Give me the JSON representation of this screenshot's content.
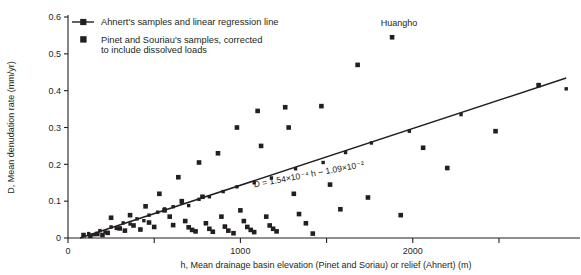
{
  "chart_data": {
    "type": "scatter",
    "title": "",
    "xlabel": "h, Mean drainage basin elevation (Pinet and Soriau) or relief (Ahnert)  (m)",
    "ylabel": "D, Mean denudation rate  (mm/yr)",
    "xlim": [
      0,
      2970
    ],
    "ylim": [
      0,
      0.6
    ],
    "grid": false,
    "legend_position": "top-left",
    "x_ticks": [
      0,
      500,
      1000,
      1500,
      2000,
      2500
    ],
    "x_tick_labels": [
      "0",
      "",
      "1000",
      "",
      "2000",
      ""
    ],
    "y_ticks": [
      0,
      0.1,
      0.2,
      0.3,
      0.4,
      0.5,
      0.6
    ],
    "y_tick_labels": [
      "0",
      "0.1",
      "0.2",
      "0.3",
      "0.4",
      "0.5",
      "0.6"
    ],
    "legend": [
      {
        "key": "ahnert",
        "label": "Ahnert's samples and linear regression line",
        "marker": "small-square-with-line"
      },
      {
        "key": "pinet",
        "label": "Pinet and Souriau's samples, corrected to include dissolved loads",
        "marker": "large-square"
      }
    ],
    "annotations": [
      {
        "name": "regression-equation",
        "text": "D = 1.54×10⁻⁴ h − 1.09×10⁻²",
        "x": 1400,
        "y": 0.165,
        "rotation": -10.6
      },
      {
        "name": "huangho-label",
        "text": "Huangho",
        "x": 1920,
        "y": 0.575
      }
    ],
    "regression": {
      "equation": "D = 1.54×10⁻⁴ h − 1.09×10⁻²",
      "slope": 0.000154,
      "intercept": -0.0109,
      "x_start": 70,
      "x_end": 2890
    },
    "series": [
      {
        "name": "Ahnert's samples and linear regression line",
        "key": "ahnert",
        "marker_size": 3.4,
        "points": [
          [
            120,
            0.012
          ],
          [
            150,
            0.009
          ],
          [
            185,
            0.02
          ],
          [
            215,
            0.016
          ],
          [
            250,
            0.03
          ],
          [
            280,
            0.026
          ],
          [
            320,
            0.041
          ],
          [
            360,
            0.038
          ],
          [
            400,
            0.052
          ],
          [
            440,
            0.047
          ],
          [
            470,
            0.062
          ],
          [
            520,
            0.07
          ],
          [
            560,
            0.079
          ],
          [
            610,
            0.085
          ],
          [
            660,
            0.096
          ],
          [
            700,
            0.088
          ],
          [
            760,
            0.105
          ],
          [
            820,
            0.112
          ],
          [
            900,
            0.126
          ],
          [
            980,
            0.139
          ],
          [
            1080,
            0.15
          ],
          [
            1180,
            0.163
          ],
          [
            1320,
            0.188
          ],
          [
            1480,
            0.205
          ],
          [
            1610,
            0.232
          ],
          [
            1760,
            0.258
          ],
          [
            1980,
            0.29
          ],
          [
            2280,
            0.335
          ],
          [
            2890,
            0.405
          ]
        ]
      },
      {
        "name": "Pinet and Souriau's samples, corrected to include dissolved loads",
        "key": "pinet",
        "marker_size": 4.6,
        "points": [
          [
            90,
            0.008
          ],
          [
            130,
            0.006
          ],
          [
            170,
            0.011
          ],
          [
            200,
            0.008
          ],
          [
            230,
            0.014
          ],
          [
            250,
            0.055
          ],
          [
            300,
            0.026
          ],
          [
            330,
            0.02
          ],
          [
            360,
            0.062
          ],
          [
            380,
            0.034
          ],
          [
            420,
            0.023
          ],
          [
            450,
            0.086
          ],
          [
            470,
            0.042
          ],
          [
            500,
            0.03
          ],
          [
            530,
            0.12
          ],
          [
            560,
            0.075
          ],
          [
            590,
            0.058
          ],
          [
            610,
            0.035
          ],
          [
            640,
            0.165
          ],
          [
            660,
            0.1
          ],
          [
            680,
            0.046
          ],
          [
            700,
            0.029
          ],
          [
            720,
            0.022
          ],
          [
            740,
            0.018
          ],
          [
            760,
            0.205
          ],
          [
            780,
            0.112
          ],
          [
            800,
            0.04
          ],
          [
            820,
            0.025
          ],
          [
            840,
            0.017
          ],
          [
            870,
            0.23
          ],
          [
            890,
            0.058
          ],
          [
            910,
            0.031
          ],
          [
            930,
            0.02
          ],
          [
            960,
            0.013
          ],
          [
            980,
            0.3
          ],
          [
            1000,
            0.075
          ],
          [
            1020,
            0.046
          ],
          [
            1040,
            0.03
          ],
          [
            1060,
            0.022
          ],
          [
            1080,
            0.016
          ],
          [
            1100,
            0.345
          ],
          [
            1120,
            0.25
          ],
          [
            1150,
            0.058
          ],
          [
            1170,
            0.034
          ],
          [
            1190,
            0.025
          ],
          [
            1210,
            0.018
          ],
          [
            1260,
            0.355
          ],
          [
            1280,
            0.3
          ],
          [
            1310,
            0.12
          ],
          [
            1340,
            0.065
          ],
          [
            1380,
            0.04
          ],
          [
            1420,
            0.012
          ],
          [
            1470,
            0.358
          ],
          [
            1520,
            0.145
          ],
          [
            1580,
            0.078
          ],
          [
            1680,
            0.47
          ],
          [
            1740,
            0.11
          ],
          [
            1880,
            0.545
          ],
          [
            1930,
            0.062
          ],
          [
            2060,
            0.245
          ],
          [
            2200,
            0.19
          ],
          [
            2480,
            0.29
          ],
          [
            2730,
            0.415
          ]
        ]
      }
    ]
  }
}
